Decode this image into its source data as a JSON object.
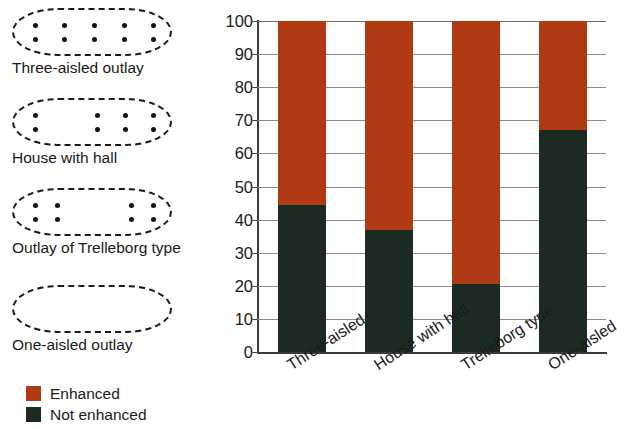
{
  "chart_data": {
    "type": "bar",
    "stacked": true,
    "normalized_percent": true,
    "title": "",
    "subtitle": "",
    "xlabel": "",
    "ylabel": "",
    "ylim": [
      0,
      100
    ],
    "ytick_step": 10,
    "yticks": [
      100,
      90,
      80,
      70,
      60,
      50,
      40,
      30,
      20,
      10,
      0
    ],
    "grid": true,
    "grid_axis": "y",
    "legend_position": "left-bottom",
    "categories": [
      "Three-aisled",
      "House with hall",
      "Trelleborg type",
      "One-aisled"
    ],
    "series": [
      {
        "name": "Enhanced",
        "color": "#B03A14",
        "values": [
          55.5,
          63,
          79.5,
          33
        ]
      },
      {
        "name": "Not enhanced",
        "color": "#1C2B22",
        "values": [
          44.5,
          37,
          20.5,
          67
        ]
      }
    ],
    "stack_order_bottom_to_top": [
      "Not enhanced",
      "Enhanced"
    ],
    "bar_totals": [
      100,
      100,
      100,
      100
    ]
  },
  "house_panel": {
    "items": [
      {
        "id": "three-aisled-outlay",
        "caption": "Three-aisled outlay",
        "post_columns": 5,
        "post_rows": 2,
        "col_positions_pct": [
          12,
          31,
          50,
          69,
          88
        ]
      },
      {
        "id": "house-with-hall",
        "caption": "House with hall",
        "post_columns": 4,
        "post_rows": 2,
        "col_positions_pct": [
          12,
          52,
          70,
          88
        ]
      },
      {
        "id": "outlay-of-trelleborg-type",
        "caption": "Outlay of Trelleborg type",
        "post_columns": 4,
        "post_rows": 2,
        "col_positions_pct": [
          12,
          26,
          74,
          88
        ]
      },
      {
        "id": "one-aisled-outlay",
        "caption": "One-aisled outlay",
        "post_columns": 0,
        "post_rows": 0,
        "col_positions_pct": []
      }
    ]
  },
  "colour_key": {
    "entries": [
      {
        "label": "Enhanced",
        "color": "#B03A14"
      },
      {
        "label": "Not enhanced",
        "color": "#1C2B22"
      }
    ]
  }
}
